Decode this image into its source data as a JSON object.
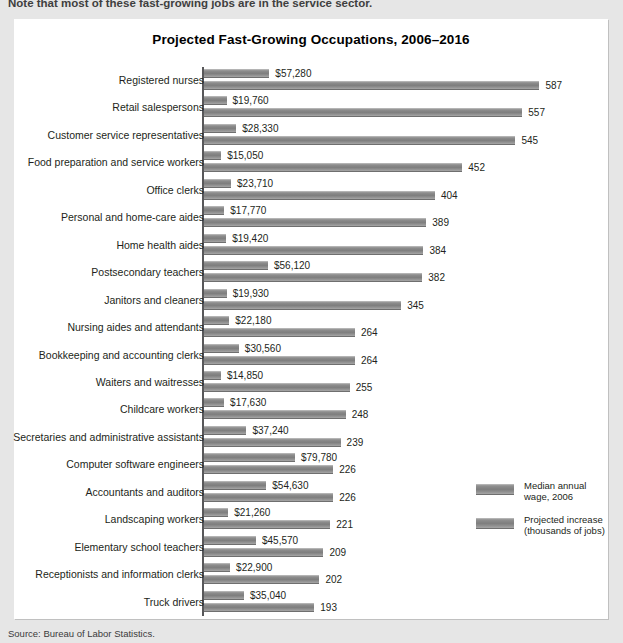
{
  "top_note": "Note that most of these fast-growing jobs are in the service sector.",
  "source": "Source: Bureau of Labor Statistics.",
  "legend": {
    "items": [
      {
        "label": "Median annual\nwage, 2006",
        "color": "#8b8b8b"
      },
      {
        "label": "Projected increase\n(thousands of jobs)",
        "color": "#8b8b8b"
      }
    ]
  },
  "chart_data": {
    "type": "bar",
    "orientation": "horizontal",
    "title": "Projected Fast-Growing Occupations, 2006–2016",
    "xlabel": "",
    "ylabel": "",
    "grid": false,
    "legend_position": "right",
    "categories": [
      "Registered nurses",
      "Retail salespersons",
      "Customer service representatives",
      "Food preparation and service workers",
      "Office clerks",
      "Personal and home-care aides",
      "Home health aides",
      "Postsecondary teachers",
      "Janitors and cleaners",
      "Nursing aides and attendants",
      "Bookkeeping and accounting clerks",
      "Waiters and waitresses",
      "Childcare workers",
      "Secretaries and administrative assistants",
      "Computer software engineers",
      "Accountants and auditors",
      "Landscaping workers",
      "Elementary school teachers",
      "Receptionists and information clerks",
      "Truck drivers"
    ],
    "series": [
      {
        "name": "Median annual wage, 2006",
        "unit": "USD",
        "values": [
          57280,
          19760,
          28330,
          15050,
          23710,
          17770,
          19420,
          56120,
          19930,
          22180,
          30560,
          14850,
          17630,
          37240,
          79780,
          54630,
          21260,
          45570,
          22900,
          35040
        ],
        "labels": [
          "$57,280",
          "$19,760",
          "$28,330",
          "$15,050",
          "$23,710",
          "$17,770",
          "$19,420",
          "$56,120",
          "$19,930",
          "$22,180",
          "$30,560",
          "$14,850",
          "$17,630",
          "$37,240",
          "$79,780",
          "$54,630",
          "$21,260",
          "$45,570",
          "$22,900",
          "$35,040"
        ],
        "max": 79780
      },
      {
        "name": "Projected increase (thousands of jobs)",
        "unit": "thousands",
        "values": [
          587,
          557,
          545,
          452,
          404,
          389,
          384,
          382,
          345,
          264,
          264,
          255,
          248,
          239,
          226,
          226,
          221,
          209,
          202,
          193
        ],
        "labels": [
          "587",
          "557",
          "545",
          "452",
          "404",
          "389",
          "384",
          "382",
          "345",
          "264",
          "264",
          "255",
          "248",
          "239",
          "226",
          "226",
          "221",
          "209",
          "202",
          "193"
        ],
        "max": 587
      }
    ]
  }
}
